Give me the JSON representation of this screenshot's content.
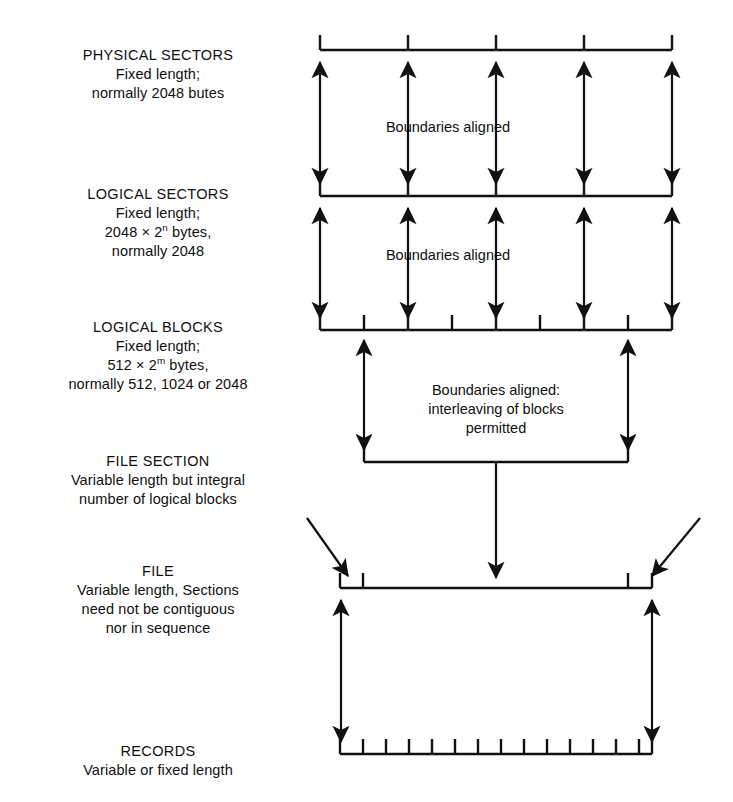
{
  "figure": {
    "kind": "storage-hierarchy-diagram",
    "background": "#ffffff",
    "ink": "#111111"
  },
  "labels": {
    "physical_sectors": {
      "title": "PHYSICAL SECTORS",
      "line2": "Fixed length;",
      "line3": "normally 2048 butes"
    },
    "logical_sectors": {
      "title": "LOGICAL SECTORS",
      "line2": "Fixed length;",
      "line3_prefix": "2048 × 2",
      "line3_exponent": "n",
      "line3_suffix": " bytes,",
      "line4": "normally 2048"
    },
    "logical_blocks": {
      "title": "LOGICAL BLOCKS",
      "line2": "Fixed length;",
      "line3_prefix": "512 × 2",
      "line3_exponent": "m",
      "line3_suffix": " bytes,",
      "line4": "normally 512, 1024 or 2048"
    },
    "file_section": {
      "title": "FILE SECTION",
      "line2": "Variable length but integral",
      "line3": "number of logical blocks"
    },
    "file": {
      "title": "FILE",
      "line2": "Variable length, Sections",
      "line3": "need not be contiguous",
      "line4": "nor in sequence"
    },
    "records": {
      "title": "RECORDS",
      "line2": "Variable or fixed length"
    }
  },
  "annotations": {
    "boundaries_aligned_1": "Boundaries aligned",
    "boundaries_aligned_2": "Boundaries aligned",
    "interleaving": {
      "line1": "Boundaries aligned:",
      "line2": "interleaving of blocks",
      "line3": "permitted"
    }
  },
  "geometry": {
    "bar_left": 320,
    "bar_right": 672,
    "sector_ticks": [
      320,
      408,
      496,
      584,
      672
    ],
    "block_ticks": [
      320,
      364,
      408,
      452,
      496,
      540,
      584,
      628,
      672
    ],
    "file_section_span": [
      364,
      628
    ],
    "file_bar": [
      340,
      652
    ],
    "file_inner_ticks": [
      363,
      628
    ],
    "record_ticks": [
      340,
      363,
      386,
      409,
      432,
      455,
      478,
      501,
      524,
      547,
      570,
      593,
      616,
      639,
      652
    ],
    "row_y": {
      "physical_sectors_bar": 50,
      "logical_sectors_bar": 196,
      "logical_blocks_bar": 330,
      "file_section_bar": 462,
      "file_bar": 588,
      "records_bar": 754
    }
  }
}
